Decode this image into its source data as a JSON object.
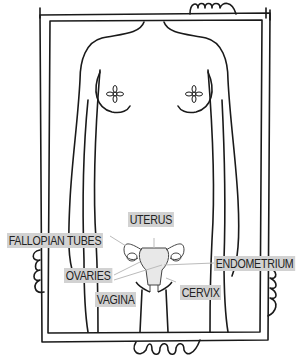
{
  "illustration": {
    "title": "Female reproductive anatomy",
    "labels": {
      "uterus": "UTERUS",
      "fallopian_tubes": "FALLOPIAN TUBES",
      "ovaries": "OVARIES",
      "endometrium": "ENDOMETRIUM",
      "vagina": "VAGINA",
      "cervix": "CERVIX"
    },
    "colors": {
      "ink": "#1a1a1a",
      "label_bg": "#d2d2d2",
      "background": "#ffffff"
    }
  }
}
